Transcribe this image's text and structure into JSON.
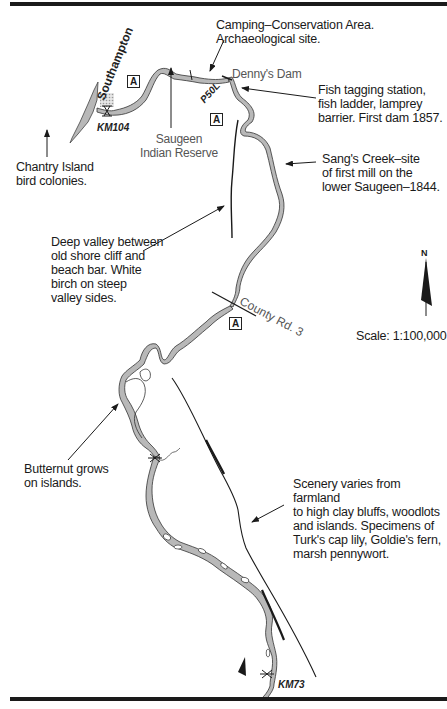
{
  "map": {
    "scale": "Scale: 1:100,000",
    "north_label": "N",
    "town": "Southampton",
    "access_symbol": "A",
    "km_markers": [
      "KM104",
      "KM73"
    ],
    "portage_label": "P50L",
    "road_label": "County Rd. 3",
    "place_labels": {
      "dennys_dam": "Denny's Dam",
      "saugeen": "Saugeen\nIndian Reserve"
    },
    "annotations": [
      {
        "id": "camping",
        "text": "Camping–Conservation Area.\n      Archaeological site."
      },
      {
        "id": "fish",
        "text": "Fish tagging station,\nfish ladder, lamprey\nbarrier. First dam 1857."
      },
      {
        "id": "chantry",
        "text": "Chantry Island\nbird colonies."
      },
      {
        "id": "sangs",
        "text": "Sang's Creek–site\nof first mill on the\nlower Saugeen–1844."
      },
      {
        "id": "valley",
        "text": "Deep valley between\nold shore cliff and\nbeach bar. White\nbirch on steep\nvalley sides."
      },
      {
        "id": "butternut",
        "text": "Butternut grows\non islands."
      },
      {
        "id": "scenery",
        "text": "Scenery varies from farmland\nto high clay bluffs, woodlots\nand islands. Specimens of\nTurk's cap lily, Goldie's fern,\nmarsh pennywort."
      }
    ],
    "colors": {
      "river_fill": "#b8b8b8",
      "ink": "#1a1a1a",
      "town_hatch": "#c8c8c8"
    }
  }
}
